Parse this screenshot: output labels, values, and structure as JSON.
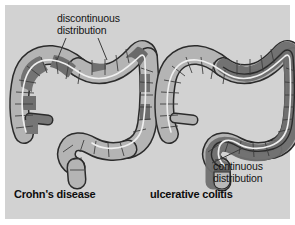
{
  "figure": {
    "kind": "medical-illustration",
    "background_color": "#d2d2d2",
    "frame_color": "#ffffff"
  },
  "annotations": {
    "discontinuous": {
      "line1": "discontinuous",
      "line2": "distribution"
    },
    "continuous": {
      "line1": "continuous",
      "line2": "distribution"
    }
  },
  "captions": {
    "left": "Crohn's disease",
    "right": "ulcerative colitis"
  },
  "palette": {
    "background": "#d2d2d2",
    "bowel_light": "#b4b4b4",
    "bowel_highlight": "#c9c9c9",
    "bowel_diseased": "#777777",
    "bowel_diseased_dark": "#6b6b6b",
    "outline": "#2b2b2b",
    "lumen_line": "#efefef",
    "text": "#141414",
    "leader_line": "#3a3a3a"
  },
  "diagrams": [
    {
      "id": "crohns-colon",
      "name": "Crohn's disease colon",
      "caption": "Crohn's disease",
      "pattern": "discontinuous",
      "description": "Large bowel with scattered skip lesions of inflammation separated by normal segments",
      "segments": [
        {
          "name": "cecum",
          "state": "mixed"
        },
        {
          "name": "ascending-colon",
          "state": "mixed"
        },
        {
          "name": "hepatic-flexure",
          "state": "diseased"
        },
        {
          "name": "transverse-colon",
          "state": "mixed"
        },
        {
          "name": "splenic-flexure",
          "state": "diseased"
        },
        {
          "name": "descending-colon",
          "state": "mixed"
        },
        {
          "name": "sigmoid-colon",
          "state": "normal"
        },
        {
          "name": "rectum",
          "state": "normal"
        },
        {
          "name": "appendix",
          "state": "diseased"
        }
      ]
    },
    {
      "id": "ulcerative-colitis-colon",
      "name": "Ulcerative colitis colon",
      "caption": "ulcerative colitis",
      "pattern": "continuous",
      "description": "Large bowel with uninterrupted inflammation extending proximally from the rectum",
      "segments": [
        {
          "name": "cecum",
          "state": "normal"
        },
        {
          "name": "ascending-colon",
          "state": "normal"
        },
        {
          "name": "hepatic-flexure",
          "state": "normal"
        },
        {
          "name": "transverse-colon",
          "state": "partly-diseased"
        },
        {
          "name": "splenic-flexure",
          "state": "diseased"
        },
        {
          "name": "descending-colon",
          "state": "diseased"
        },
        {
          "name": "sigmoid-colon",
          "state": "diseased"
        },
        {
          "name": "rectum",
          "state": "diseased"
        },
        {
          "name": "appendix",
          "state": "normal"
        }
      ]
    }
  ],
  "leader_lines": [
    {
      "name": "discontinuous-left",
      "from": "label",
      "to": "crohns-transverse-lesion"
    },
    {
      "name": "discontinuous-right",
      "from": "label",
      "to": "crohns-splenic-lesion"
    },
    {
      "name": "continuous",
      "from": "label",
      "to": "uc-sigmoid"
    }
  ]
}
